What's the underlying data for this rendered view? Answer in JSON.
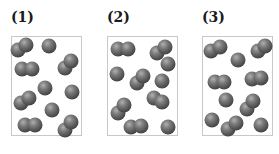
{
  "panels": [
    {
      "label": "(1)",
      "left": 11,
      "atoms": [
        [
          6,
          13
        ],
        [
          14,
          8
        ],
        [
          37,
          9
        ],
        [
          10,
          32
        ],
        [
          20,
          32
        ],
        [
          53,
          31
        ],
        [
          59,
          24
        ],
        [
          33,
          51
        ],
        [
          60,
          55
        ],
        [
          9,
          66
        ],
        [
          17,
          61
        ],
        [
          40,
          73
        ],
        [
          13,
          88
        ],
        [
          23,
          88
        ],
        [
          53,
          93
        ],
        [
          59,
          85
        ]
      ]
    },
    {
      "label": "(2)",
      "left": 107,
      "atoms": [
        [
          10,
          12
        ],
        [
          20,
          12
        ],
        [
          49,
          16
        ],
        [
          57,
          10
        ],
        [
          60,
          27
        ],
        [
          9,
          37
        ],
        [
          29,
          46
        ],
        [
          35,
          39
        ],
        [
          54,
          44
        ],
        [
          46,
          61
        ],
        [
          54,
          65
        ],
        [
          10,
          76
        ],
        [
          16,
          68
        ],
        [
          23,
          90
        ],
        [
          33,
          89
        ],
        [
          60,
          90
        ]
      ]
    },
    {
      "label": "(3)",
      "left": 202,
      "atoms": [
        [
          8,
          14
        ],
        [
          17,
          10
        ],
        [
          35,
          23
        ],
        [
          55,
          14
        ],
        [
          62,
          9
        ],
        [
          12,
          45
        ],
        [
          21,
          45
        ],
        [
          49,
          42
        ],
        [
          58,
          41
        ],
        [
          23,
          63
        ],
        [
          44,
          72
        ],
        [
          50,
          64
        ],
        [
          9,
          83
        ],
        [
          25,
          92
        ],
        [
          33,
          86
        ],
        [
          58,
          88
        ]
      ]
    }
  ],
  "colors": {
    "border": "#c8c8c8",
    "atom_dark": "#2e2e2e",
    "atom_light": "#b0b0b0"
  }
}
